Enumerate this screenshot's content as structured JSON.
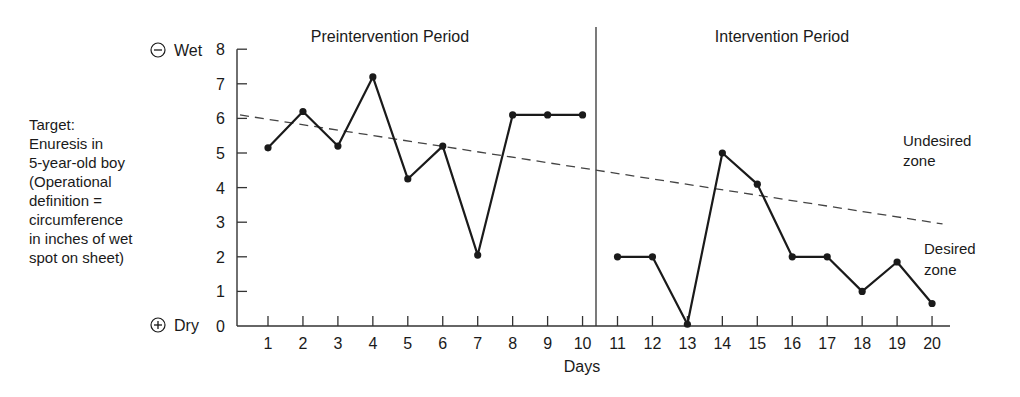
{
  "chart_data": {
    "type": "line",
    "title": "",
    "phases": [
      {
        "label": "Preintervention Period",
        "days": [
          1,
          10
        ]
      },
      {
        "label": "Intervention Period",
        "days": [
          11,
          20
        ]
      }
    ],
    "xlabel": "Days",
    "ylabel": "Target: Enuresis in 5-year-old boy (Operational definition = circumference in inches of wet spot on sheet)",
    "ylim": [
      0,
      8
    ],
    "xlim": [
      0,
      20.5
    ],
    "x": [
      1,
      2,
      3,
      4,
      5,
      6,
      7,
      8,
      9,
      10,
      11,
      12,
      13,
      14,
      15,
      16,
      17,
      18,
      19,
      20
    ],
    "series": [
      {
        "name": "Wet spot circumference (inches)",
        "values": [
          5.15,
          6.2,
          5.2,
          7.2,
          4.25,
          5.2,
          2.05,
          6.1,
          6.1,
          6.1,
          2.0,
          2.0,
          0.05,
          5.0,
          4.1,
          2.0,
          2.0,
          1.0,
          1.85,
          0.65
        ]
      }
    ],
    "trend_line": {
      "style": "dashed",
      "start": {
        "x": 0.2,
        "y": 6.1
      },
      "end": {
        "x": 20.3,
        "y": 2.95
      }
    },
    "y_ticks": [
      0,
      1,
      2,
      3,
      4,
      5,
      6,
      7,
      8
    ],
    "x_ticks": [
      1,
      2,
      3,
      4,
      5,
      6,
      7,
      8,
      9,
      10,
      11,
      12,
      13,
      14,
      15,
      16,
      17,
      18,
      19,
      20
    ],
    "annotations": [
      {
        "text": "Undesired zone",
        "position": "above trend line, right"
      },
      {
        "text": "Desired zone",
        "position": "below trend line, right"
      },
      {
        "text": "⊖ Wet",
        "position": "y=8"
      },
      {
        "text": "⊕ Dry",
        "position": "y=0"
      }
    ],
    "phase_divider_x": 10.5,
    "grid": false,
    "legend": "none"
  },
  "labels": {
    "phase_pre": "Preintervention Period",
    "phase_int": "Intervention Period",
    "wet": "Wet",
    "dry": "Dry",
    "wet_symbol": "⊖",
    "dry_symbol": "⊕",
    "xlabel": "Days",
    "undesired_1": "Undesired",
    "undesired_2": "zone",
    "desired_1": "Desired",
    "desired_2": "zone",
    "target_lines": [
      "Target:",
      "Enuresis in",
      "5-year-old boy",
      "(Operational",
      "definition =",
      "circumference",
      "in inches of wet",
      "spot on sheet)"
    ]
  },
  "colors": {
    "line": "#1a1a1a",
    "axis": "#333333",
    "trend": "#444444"
  }
}
